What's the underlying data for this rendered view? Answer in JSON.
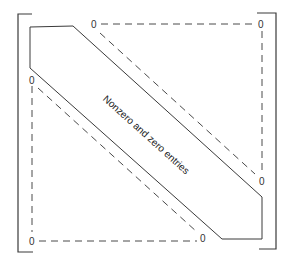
{
  "figure": {
    "type": "banded-matrix-diagram",
    "band_label": "Nonzero and zero entries",
    "zero_symbol": "0",
    "zero_labels": {
      "top_band_start": "0",
      "top_right_corner": "0",
      "left_band_start": "0",
      "right_band_end": "0",
      "bottom_left_corner": "0",
      "bottom_band_end": "0"
    },
    "regions": {
      "upper_triangle": "zero entries (dashed outline)",
      "band": "nonzero and zero entries (solid outline)",
      "lower_triangle": "zero entries (dashed outline)"
    },
    "colors": {
      "line": "#3a3a3a",
      "dashed_line": "#4a4a4a",
      "text": "#222222",
      "background": "#ffffff"
    }
  }
}
